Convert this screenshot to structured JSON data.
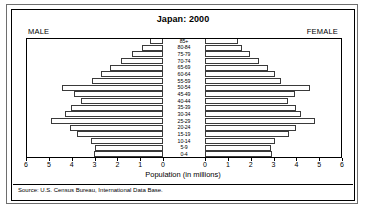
{
  "chart_data": {
    "type": "bar",
    "subtype": "population-pyramid",
    "title": "Japan: 2000",
    "xlabel": "Population (in millions)",
    "ylabel": "",
    "xlim": [
      0,
      6
    ],
    "xticks": [
      0,
      1,
      2,
      3,
      4,
      5,
      6
    ],
    "grid": false,
    "left_label": "MALE",
    "right_label": "FEMALE",
    "source": "Source: U.S. Census Bureau, International Data Base.",
    "categories": [
      "85+",
      "80-84",
      "75-79",
      "70-74",
      "65-69",
      "60-64",
      "55-59",
      "50-54",
      "45-49",
      "40-44",
      "35-39",
      "30-34",
      "25-29",
      "20-24",
      "15-19",
      "10-14",
      "5-9",
      "0-4"
    ],
    "series": [
      {
        "name": "MALE",
        "direction": "left",
        "values": [
          0.55,
          0.92,
          1.38,
          1.83,
          2.32,
          2.72,
          3.13,
          4.42,
          3.9,
          3.58,
          4.02,
          4.28,
          4.92,
          4.08,
          3.78,
          3.17,
          2.98,
          3.03
        ]
      },
      {
        "name": "FEMALE",
        "direction": "right",
        "values": [
          1.45,
          1.62,
          1.98,
          2.35,
          2.78,
          3.05,
          3.35,
          4.58,
          3.95,
          3.62,
          3.98,
          4.22,
          4.82,
          3.98,
          3.68,
          3.05,
          2.88,
          2.93
        ]
      }
    ],
    "colors": {
      "bar_fill": "#ffffff",
      "bar_stroke": "#3a3a3a",
      "axis": "#000000",
      "background": "#ffffff",
      "outer_frame": "#6e6e6e"
    }
  }
}
